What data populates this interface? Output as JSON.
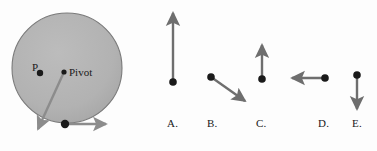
{
  "figure": {
    "type": "physics-vector-diagram",
    "background_color": "#fdfdfd",
    "disk": {
      "name": "rotating-disk",
      "cx": 67,
      "cy": 68,
      "r": 55,
      "fill_color": "#b3b3b3",
      "stroke_color": "#7a7a7a"
    },
    "points": [
      {
        "name": "point-p",
        "label": "P",
        "x": 40,
        "y": 73,
        "label_x": 32,
        "label_y": 62,
        "dot_color": "#1a1a1a",
        "dot_r": 3.2
      },
      {
        "name": "pivot-point",
        "label": "Pivot",
        "x": 64,
        "y": 72,
        "label_x": 69,
        "label_y": 67,
        "dot_color": "#1a1a1a",
        "dot_r": 2.6
      },
      {
        "name": "rim-point",
        "label": "",
        "x": 65,
        "y": 124,
        "label_x": 0,
        "label_y": 0,
        "dot_color": "#1a1a1a",
        "dot_r": 4.2
      }
    ],
    "disk_vectors": [
      {
        "name": "radial-acceleration-arrow",
        "x1": 64,
        "y1": 72,
        "x2": 38,
        "y2": 129,
        "color": "#8c8c8c",
        "width": 2.4
      },
      {
        "name": "tangential-velocity-arrow",
        "x1": 68,
        "y1": 124,
        "x2": 106,
        "y2": 124,
        "color": "#8c8c8c",
        "width": 2.4
      }
    ],
    "choices": [
      {
        "name": "choice-a",
        "label": "A.",
        "label_x": 167,
        "label_y": 118,
        "dot_x": 173,
        "dot_y": 82,
        "tip_x": 173,
        "tip_y": 13,
        "direction": "up",
        "color": "#6e6e6e",
        "dot_color": "#1a1a1a"
      },
      {
        "name": "choice-b",
        "label": "B.",
        "label_x": 207,
        "label_y": 118,
        "dot_x": 211,
        "dot_y": 77,
        "tip_x": 245,
        "tip_y": 101,
        "direction": "down-right",
        "color": "#6e6e6e",
        "dot_color": "#1a1a1a"
      },
      {
        "name": "choice-c",
        "label": "C.",
        "label_x": 256,
        "label_y": 118,
        "dot_x": 262,
        "dot_y": 79,
        "tip_x": 262,
        "tip_y": 45,
        "direction": "up",
        "color": "#6e6e6e",
        "dot_color": "#1a1a1a"
      },
      {
        "name": "choice-d",
        "label": "D.",
        "label_x": 318,
        "label_y": 118,
        "dot_x": 325,
        "dot_y": 78,
        "tip_x": 292,
        "tip_y": 78,
        "direction": "left",
        "color": "#6e6e6e",
        "dot_color": "#1a1a1a"
      },
      {
        "name": "choice-e",
        "label": "E.",
        "label_x": 352,
        "label_y": 118,
        "dot_x": 357,
        "dot_y": 75,
        "tip_x": 357,
        "tip_y": 109,
        "direction": "down",
        "color": "#6e6e6e",
        "dot_color": "#1a1a1a"
      }
    ]
  }
}
